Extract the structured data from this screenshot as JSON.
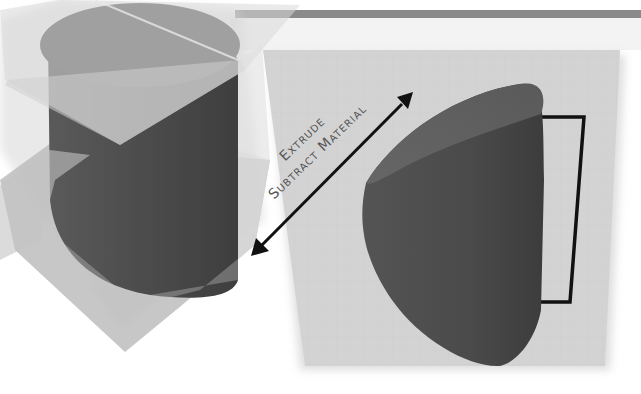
{
  "diagram": {
    "type": "3d-cad-illustration",
    "annotation": {
      "line1": "Extrude",
      "line2": "Subtract Material"
    },
    "left_figure": {
      "description": "Cylinder intersected by translucent cutting planes",
      "parts": [
        "cylinder",
        "translucent-plane-upper",
        "translucent-plane-lower"
      ]
    },
    "right_figure": {
      "description": "Resulting angled-cut cylinder on sketch plane with rectangular profile",
      "parts": [
        "sketch-plane",
        "cut-cylinder",
        "rectangle-profile"
      ]
    },
    "arrow": {
      "type": "double-headed",
      "direction": "diagonal"
    },
    "colors": {
      "background": "#ffffff",
      "top_bar": "#8a8a8a",
      "plane": "#d2d2d2",
      "cylinder_dark": "#4e4e4e",
      "cylinder_top": "#5e5e5e",
      "glass": "#bdbdbd",
      "outline": "#111111",
      "text": "#555555"
    }
  }
}
